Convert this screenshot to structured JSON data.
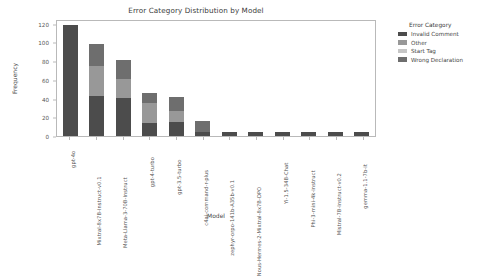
{
  "chart_data": {
    "type": "bar",
    "stacked": true,
    "title": "Error Category Distribution by Model",
    "xlabel": "Model",
    "ylabel": "Frequency",
    "ylim": [
      0,
      125
    ],
    "yticks": [
      0,
      20,
      40,
      60,
      80,
      100,
      120
    ],
    "grid": false,
    "legend_position": "right",
    "legend_title": "Error Category",
    "categories": [
      "gpt-4o",
      "Mixtral-8x7B-Instruct-v0.1",
      "Meta-Llama-3-70B-Instruct",
      "gpt-4-turbo",
      "gpt-3.5-turbo",
      "c4ai-command-r-plus",
      "zephyr-orpo-141b-A35b-v0.1",
      "Nous-Hermes-2-Mixtral-8x7B-DPO",
      "Yi-1.5-34B-Chat",
      "Phi-3-mini-4k-instruct",
      "Mistral-7B-Instruct-v0.2",
      "gemma-1.1-7b-it"
    ],
    "series": [
      {
        "name": "Invalid Comment",
        "color": "#4c4c4c",
        "values": [
          119,
          43,
          41,
          14,
          15,
          4,
          4,
          4,
          4,
          4,
          4,
          4
        ]
      },
      {
        "name": "Other",
        "color": "#989898",
        "values": [
          0,
          32,
          20,
          21,
          12,
          0,
          0,
          0,
          0,
          0,
          0,
          0
        ]
      },
      {
        "name": "Start Tag",
        "color": "#c6c6c6",
        "values": [
          0,
          0,
          0,
          0,
          0,
          0,
          0,
          0,
          0,
          0,
          0,
          0
        ]
      },
      {
        "name": "Wrong Declaration",
        "color": "#6e6e6e",
        "values": [
          0,
          23,
          20,
          11,
          15,
          12,
          0,
          0,
          0,
          0,
          0,
          0
        ]
      }
    ],
    "totals": [
      119,
      98,
      81,
      46,
      42,
      16,
      4,
      4,
      4,
      4,
      4,
      4
    ]
  }
}
